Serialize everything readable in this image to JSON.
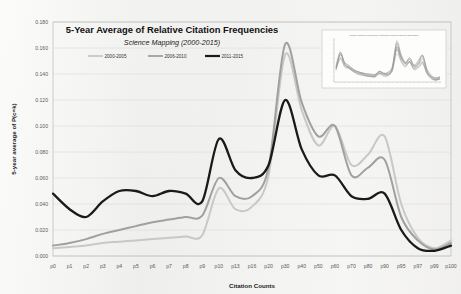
{
  "chart_data": {
    "type": "line",
    "title": "5-Year Average of Relative Citation Frequencies",
    "subtitle": "Science Mapping (2000-2015)",
    "xlabel": "Citation Counts",
    "ylabel": "5-year average of P(c=k)",
    "ylim": [
      0.0,
      0.18
    ],
    "ytick_step": 0.02,
    "grid": true,
    "legend_position": "top-left-inside",
    "categories": [
      "p0",
      "p1",
      "p2",
      "p3",
      "p4",
      "p5",
      "p6",
      "p7",
      "p8",
      "p9",
      "p10",
      "p13",
      "p16",
      "p20",
      "p30",
      "p40",
      "p50",
      "p60",
      "p70",
      "p80",
      "p90",
      "p95",
      "p97",
      "p99",
      "p100"
    ],
    "ytick_labels": [
      "0.000",
      "0.020",
      "0.040",
      "0.060",
      "0.080",
      "0.100",
      "0.120",
      "0.140",
      "0.160",
      "0.180"
    ],
    "series": [
      {
        "name": "2000-2005",
        "color": "#c8c8c8",
        "width": 2.0,
        "values": [
          0.006,
          0.007,
          0.008,
          0.01,
          0.011,
          0.012,
          0.013,
          0.014,
          0.015,
          0.016,
          0.052,
          0.036,
          0.038,
          0.062,
          0.155,
          0.112,
          0.085,
          0.1,
          0.07,
          0.078,
          0.092,
          0.04,
          0.014,
          0.006,
          0.012
        ]
      },
      {
        "name": "2006-2010",
        "color": "#a0a0a0",
        "width": 2.0,
        "values": [
          0.008,
          0.01,
          0.013,
          0.017,
          0.02,
          0.023,
          0.026,
          0.028,
          0.03,
          0.031,
          0.06,
          0.046,
          0.046,
          0.068,
          0.163,
          0.118,
          0.092,
          0.1,
          0.062,
          0.068,
          0.074,
          0.03,
          0.012,
          0.005,
          0.01
        ]
      },
      {
        "name": "2011-2015",
        "color": "#1a1a1a",
        "width": 2.3,
        "values": [
          0.048,
          0.036,
          0.03,
          0.042,
          0.05,
          0.05,
          0.046,
          0.05,
          0.048,
          0.042,
          0.09,
          0.066,
          0.06,
          0.07,
          0.12,
          0.082,
          0.062,
          0.062,
          0.046,
          0.044,
          0.048,
          0.02,
          0.006,
          0.004,
          0.008
        ]
      }
    ],
    "inset": {
      "title": "Relative Citation Frequencies of Citations in Science Mapping (2000-2015)",
      "description": "thumbnail of full yearly series, many overlapping gray lines"
    }
  },
  "legend": {
    "items": [
      {
        "label": "2000-2005",
        "color": "#c8c8c8"
      },
      {
        "label": "2006-2010",
        "color": "#a0a0a0"
      },
      {
        "label": "2011-2015",
        "color": "#1a1a1a"
      }
    ]
  }
}
